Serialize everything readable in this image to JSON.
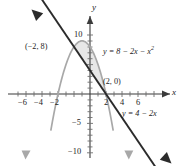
{
  "chart_data": {
    "type": "line",
    "title": "",
    "xlabel": "x",
    "ylabel": "y",
    "xlim": [
      -7.5,
      7.5
    ],
    "ylim": [
      -11.5,
      12.5
    ],
    "grid": false,
    "legend": "none",
    "x_ticks": [
      -6,
      -4,
      -2,
      2,
      4,
      6
    ],
    "x_tick_labels": [
      "−6",
      "−4",
      "−2",
      "2",
      "4",
      "6"
    ],
    "y_ticks": [
      10,
      -5,
      -10
    ],
    "y_tick_labels": [
      "10",
      "−5",
      "−10"
    ],
    "series": [
      {
        "name": "parabola",
        "equation": "y = 8 − 2x − x²",
        "color": "#a8a8a8",
        "type": "quadratic",
        "coefficients": {
          "a": -1,
          "b": -2,
          "c": 8
        },
        "roots": [
          -4,
          2
        ],
        "vertex": {
          "x": -1,
          "y": 9
        }
      },
      {
        "name": "line",
        "equation": "y = 4 − 2x",
        "color": "#2b2b2b",
        "type": "linear",
        "coefficients": {
          "m": -2,
          "b": 4
        }
      }
    ],
    "intersections": [
      {
        "x": -2,
        "y": 8,
        "label": "(−2, 8)"
      },
      {
        "x": 2,
        "y": 0,
        "label": "(2, 0)"
      }
    ],
    "shaded_region": {
      "between": [
        "line",
        "parabola"
      ],
      "x_from": -2,
      "x_to": 2,
      "color": "#d8d8d8"
    }
  },
  "labels": {
    "axis_x": "x",
    "axis_y": "y",
    "point_upper": "(−2, 8)",
    "point_lower": "(2, 0)",
    "eq_parabola_main": "y = 8 − 2x − x",
    "eq_parabola_exp": "2",
    "eq_line": "y = 4 − 2x",
    "x_tick_neg6": "−6",
    "x_tick_neg4": "−4",
    "x_tick_neg2": "−2",
    "x_tick_2": "2",
    "x_tick_4": "4",
    "x_tick_6": "6",
    "y_tick_10": "10",
    "y_tick_neg5": "−5",
    "y_tick_neg10": "−10"
  }
}
